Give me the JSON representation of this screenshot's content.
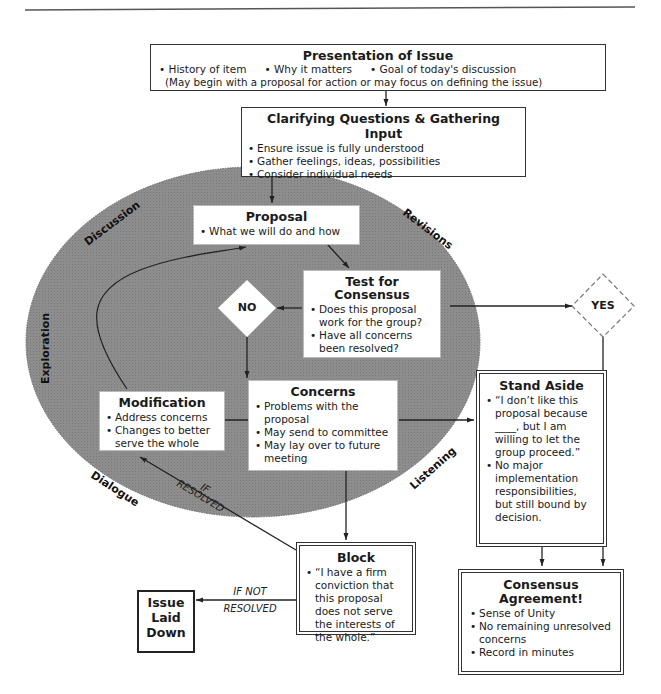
{
  "presentation": {
    "title": "Presentation of Issue",
    "bullets": [
      "History of item",
      "Why it matters",
      "Goal of today's discussion"
    ],
    "note": "(May begin with a proposal for action or may focus on defining the issue)"
  },
  "clarifying": {
    "title": "Clarifying Questions & Gathering Input",
    "bullets": [
      "Ensure issue is fully understood",
      "Gather feelings, ideas, possibilities",
      "Consider individual needs"
    ]
  },
  "proposal": {
    "title": "Proposal",
    "bullets": [
      "What we will do and how"
    ]
  },
  "test": {
    "title_line1": "Test for",
    "title_line2": "Consensus",
    "bullets": [
      "Does this proposal work for the group?",
      "Have all concerns been resolved?"
    ]
  },
  "decisions": {
    "no": "NO",
    "yes": "YES"
  },
  "modification": {
    "title": "Modification",
    "bullets": [
      "Address concerns",
      "Changes to better serve the whole"
    ]
  },
  "concerns": {
    "title": "Concerns",
    "bullets": [
      "Problems with the proposal",
      "May send to committee",
      "May lay over to future meeting"
    ]
  },
  "stand_aside": {
    "title": "Stand Aside",
    "bullets": [
      "“I don’t like this proposal because ____, but I am willing to let the group proceed.”",
      "No major implementation responsibilities, but still bound by decision."
    ]
  },
  "block": {
    "title": "Block",
    "bullets": [
      "“I have a firm conviction that this proposal does not serve the interests of the whole.”"
    ]
  },
  "issue_laid_down": {
    "line1": "Issue",
    "line2": "Laid",
    "line3": "Down"
  },
  "consensus": {
    "title_line1": "Consensus",
    "title_line2": "Agreement!",
    "bullets": [
      "Sense of Unity",
      "No remaining unresolved concerns",
      "Record in minutes"
    ]
  },
  "edge_labels": {
    "if_resolved_1": "IF",
    "if_resolved_2": "RESOLVED",
    "if_not_resolved_1": "IF NOT",
    "if_not_resolved_2": "RESOLVED"
  },
  "ring_labels": {
    "discussion": "Discussion",
    "revisions": "Revisions",
    "exploration": "Exploration",
    "dialogue": "Dialogue",
    "listening": "Listening"
  },
  "colors": {
    "ellipse_fill": "#8a8a8a",
    "line": "#222222",
    "box_fill": "#ffffff"
  }
}
